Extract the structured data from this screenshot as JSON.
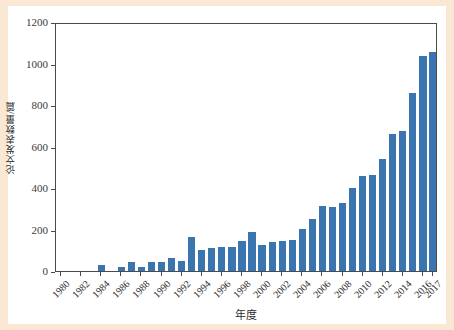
{
  "figure": {
    "background_color": "#fae8d5",
    "panel_color": "#ffffff",
    "bar_color": "#3b75af",
    "axis_color": "#4a4a4a"
  },
  "axis_titles": {
    "y": "论文发表数量/篇",
    "x": "年度"
  },
  "chart_data": {
    "type": "bar",
    "title": "",
    "xlabel": "年度",
    "ylabel": "论文发表数量/篇",
    "ylim": [
      0,
      1200
    ],
    "yticks": [
      0,
      200,
      400,
      600,
      800,
      1000,
      1200
    ],
    "grid": false,
    "legend": null,
    "bar_color": "#3b75af",
    "tick_labels_x": [
      "1980",
      "1982",
      "1984",
      "1986",
      "1988",
      "1990",
      "1992",
      "1994",
      "1996",
      "1998",
      "2000",
      "2002",
      "2004",
      "2006",
      "2008",
      "2010",
      "2012",
      "2014",
      "2016",
      "2017"
    ],
    "categories": [
      "1980",
      "1981",
      "1982",
      "1983",
      "1984",
      "1985",
      "1986",
      "1987",
      "1988",
      "1989",
      "1990",
      "1991",
      "1992",
      "1993",
      "1994",
      "1995",
      "1996",
      "1997",
      "1998",
      "1999",
      "2000",
      "2001",
      "2002",
      "2003",
      "2004",
      "2005",
      "2006",
      "2007",
      "2008",
      "2009",
      "2010",
      "2011",
      "2012",
      "2013",
      "2014",
      "2015",
      "2016",
      "2017"
    ],
    "values": [
      0,
      0,
      0,
      0,
      30,
      0,
      20,
      44,
      19,
      42,
      42,
      65,
      48,
      163,
      101,
      110,
      115,
      118,
      147,
      186,
      125,
      141,
      144,
      150,
      203,
      253,
      311,
      308,
      328,
      399,
      457,
      464,
      540,
      661,
      675,
      860,
      1038,
      1055
    ]
  }
}
